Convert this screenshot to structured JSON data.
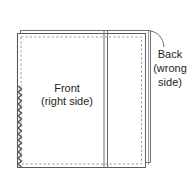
{
  "diagram": {
    "title_visible": false,
    "background_color": "#ffffff",
    "line_color": "#58595b",
    "fabric_fill": "#ffffff",
    "text_color": "#231f20",
    "stitch_style": "dashed",
    "labels": [
      {
        "id": "front-label",
        "lines": [
          "Front",
          "(right side)"
        ],
        "line1": "Front",
        "line2": "(right side)",
        "x": 67,
        "y": 92,
        "align": "center"
      },
      {
        "id": "back-label",
        "lines": [
          "Back",
          "(wrong",
          "side)"
        ],
        "line1": "Back",
        "line2": "(wrong",
        "line3": "side)",
        "x": 170,
        "y": 57,
        "align": "center",
        "has_leader_line": true
      }
    ],
    "parts": [
      {
        "id": "back-panel",
        "name": "back-panel",
        "description": "Back fabric panel, wrong side, offset up and right behind the front panel"
      },
      {
        "id": "front-panel",
        "name": "front-panel",
        "description": "Front fabric panel, right side facing, with dashed stitching line inset from edges"
      },
      {
        "id": "pinked-edge",
        "name": "pinked-edge",
        "description": "Zigzag pinked raw edge along the lower left side of the front panel"
      },
      {
        "id": "center-seam",
        "name": "center-seam",
        "description": "Vertical double seam line running full height right of center"
      }
    ],
    "icons": {
      "leader_line": "curved-leader-line"
    }
  }
}
